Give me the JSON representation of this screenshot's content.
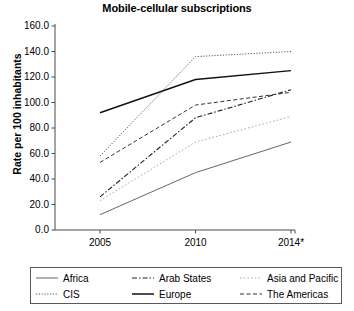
{
  "chart_data": {
    "type": "line",
    "title": "Mobile-cellular subscriptions",
    "xlabel": "",
    "ylabel": "Rate per 100 inhabitants",
    "categories": [
      "2005",
      "2010",
      "2014*"
    ],
    "x_tick_labels": [
      "2005",
      "2010",
      "2014*"
    ],
    "y_tick_labels": [
      "0.0",
      "20.0",
      "40.0",
      "60.0",
      "80.0",
      "100.0",
      "120.0",
      "140.0",
      "160.0"
    ],
    "y_tick_values": [
      0,
      20,
      40,
      60,
      80,
      100,
      120,
      140,
      160
    ],
    "ylim": [
      0,
      160
    ],
    "grid": false,
    "legend_position": "bottom",
    "series": [
      {
        "name": "Africa",
        "values": [
          12,
          45,
          69
        ],
        "style": "solid-thin",
        "color": "#555555"
      },
      {
        "name": "CIS",
        "values": [
          58,
          136,
          140
        ],
        "style": "dotted-fine",
        "color": "#444444"
      },
      {
        "name": "Arab States",
        "values": [
          26,
          88,
          110
        ],
        "style": "dash-dot",
        "color": "#222222"
      },
      {
        "name": "Europe",
        "values": [
          92,
          118,
          125
        ],
        "style": "solid-thick",
        "color": "#111111"
      },
      {
        "name": "Asia and Pacific",
        "values": [
          23,
          69,
          89
        ],
        "style": "dotted",
        "color": "#999999"
      },
      {
        "name": "The Americas",
        "values": [
          53,
          98,
          108
        ],
        "style": "dashed",
        "color": "#333333"
      }
    ]
  },
  "legend": {
    "entries": [
      {
        "label": "Africa"
      },
      {
        "label": "Arab States"
      },
      {
        "label": "Asia and Pacific"
      },
      {
        "label": "CIS"
      },
      {
        "label": "Europe"
      },
      {
        "label": "The Americas"
      }
    ]
  }
}
